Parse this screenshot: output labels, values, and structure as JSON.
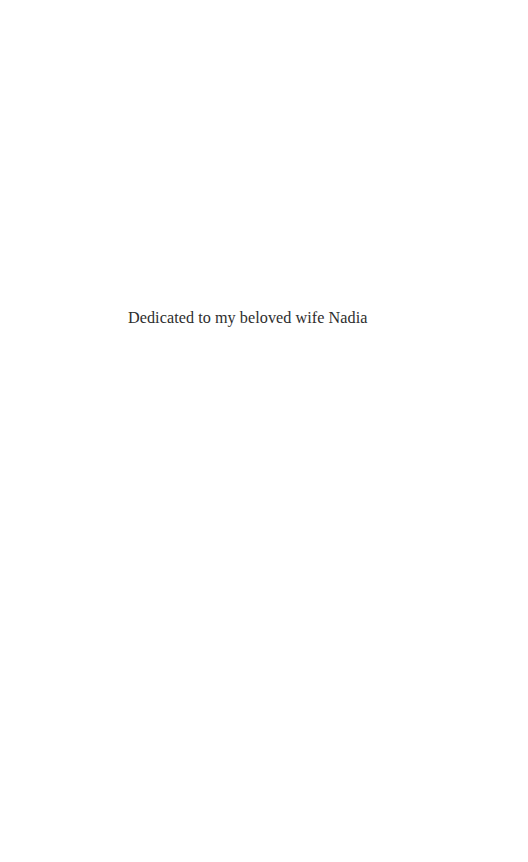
{
  "page": {
    "dedication": "Dedicated to my beloved wife Nadia",
    "background_color": "#ffffff",
    "text_color": "#2e2e2e"
  }
}
